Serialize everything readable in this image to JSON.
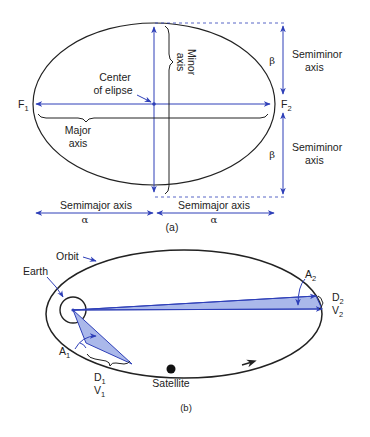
{
  "colors": {
    "line_blue": "#2e3fb8",
    "fill_blue": "#aab8ea",
    "ellipse_black": "#222222"
  },
  "panel_a": {
    "caption": "(a)",
    "center_label_line1": "Center",
    "center_label_line2": "of elipse",
    "major_axis_line1": "Major",
    "major_axis_line2": "axis",
    "minor_axis_line1": "Minor",
    "minor_axis_line2": "axis",
    "focus1": "F",
    "focus1_sub": "1",
    "focus2": "F",
    "focus2_sub": "2",
    "semiminor_top_line1": "Semiminor",
    "semiminor_top_line2": "axis",
    "semiminor_bottom_line1": "Semiminor",
    "semiminor_bottom_line2": "axis",
    "beta_top": "β",
    "beta_bottom": "β",
    "semimajor_left": "Semimajor axis",
    "semimajor_right": "Semimajor axis",
    "alpha_left": "α",
    "alpha_right": "α"
  },
  "panel_b": {
    "caption": "(b)",
    "orbit_label": "Orbit",
    "earth_label": "Earth",
    "satellite_label": "Satellite",
    "a1": "A",
    "a1_sub": "1",
    "a2": "A",
    "a2_sub": "2",
    "d1": "D",
    "d1_sub": "1",
    "v1": "V",
    "v1_sub": "1",
    "d2": "D",
    "d2_sub": "2",
    "v2": "V",
    "v2_sub": "2"
  }
}
